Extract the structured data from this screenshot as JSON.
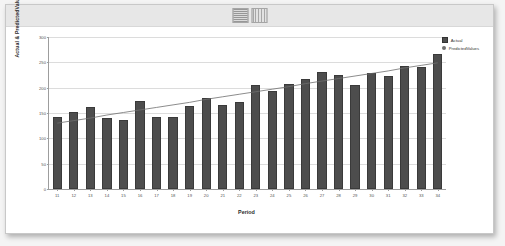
{
  "window": {
    "header_thumb_left": "thumbnail-graphic-a",
    "header_thumb_right": "thumbnail-graphic-b"
  },
  "chart_data": {
    "type": "bar",
    "title": "",
    "xlabel": "Period",
    "ylabel": "Actual & PredictedValues",
    "categories": [
      "11",
      "12",
      "13",
      "14",
      "15",
      "16",
      "17",
      "18",
      "19",
      "20",
      "21",
      "22",
      "23",
      "24",
      "25",
      "26",
      "27",
      "28",
      "29",
      "30",
      "31",
      "32",
      "33",
      "34"
    ],
    "ylim": [
      0,
      300
    ],
    "yticks": [
      0,
      50,
      100,
      150,
      200,
      250,
      300
    ],
    "grid": true,
    "legend_position": "top-right",
    "series": [
      {
        "name": "Actual",
        "kind": "bar",
        "color": "#4d4d4d",
        "marker": "square",
        "values": [
          143,
          152,
          161,
          140,
          137,
          174,
          143,
          142,
          163,
          180,
          165,
          172,
          206,
          194,
          207,
          218,
          230,
          225,
          205,
          229,
          224,
          243,
          241,
          267
        ]
      },
      {
        "name": "PredictedValues",
        "kind": "line",
        "color": "#6f6f6f",
        "marker": "circle",
        "values": [
          130,
          135,
          140,
          146,
          151,
          156,
          161,
          166,
          171,
          177,
          182,
          187,
          192,
          197,
          202,
          208,
          213,
          218,
          223,
          228,
          233,
          239,
          244,
          249
        ]
      }
    ]
  }
}
